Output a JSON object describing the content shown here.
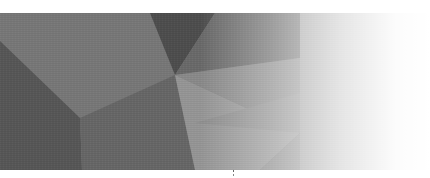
{
  "image": {
    "description": "Abstract low-poly geometric grayscale banner fading to white on the right",
    "palette": {
      "darkest": "#4a4a4a",
      "dark": "#5e5e5e",
      "mid_dark": "#6e6e6e",
      "mid": "#7c7c7c",
      "mid_light": "#8e8e8e",
      "light": "#9c9c9c",
      "fade_to": "#ffffff",
      "background": "#ffffff"
    },
    "polygons": [
      {
        "name": "top-left-facet",
        "points": "0,0 190,0 175,62 80,105 0,28",
        "fill": "#787878"
      },
      {
        "name": "top-dark-notch",
        "points": "150,0 215,0 175,62",
        "fill": "#4e4e4e"
      },
      {
        "name": "top-center-facet",
        "points": "175,62 215,0 300,0 300,120",
        "fill": "#8a8a8a"
      },
      {
        "name": "left-dark-facet",
        "points": "0,28 80,105 82,157 0,157",
        "fill": "#5a5a5a"
      },
      {
        "name": "lower-left-facet",
        "points": "80,105 175,62 195,157 82,157",
        "fill": "#686868"
      },
      {
        "name": "center-facet",
        "points": "175,62 300,120 195,157",
        "fill": "#979797"
      },
      {
        "name": "lower-center-facet",
        "points": "195,157 300,120 300,157",
        "fill": "#8c8c8c"
      },
      {
        "name": "right-facet",
        "points": "300,0 430,0 430,157 300,157",
        "fill": "#9a9a9a"
      }
    ]
  }
}
